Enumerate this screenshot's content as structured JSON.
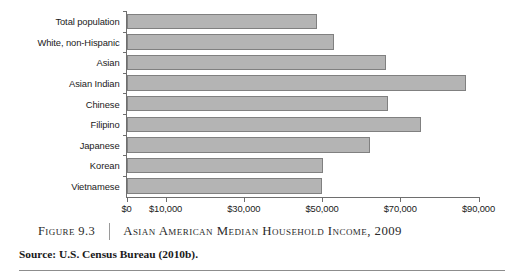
{
  "chart_data": {
    "type": "bar",
    "orientation": "horizontal",
    "title": "Asian American Median Household Income, 2009",
    "xlabel": "",
    "ylabel": "",
    "grid": false,
    "legend": null,
    "xlim": [
      0,
      95000
    ],
    "categories": [
      "Total population",
      "White, non-Hispanic",
      "Asian",
      "Asian Indian",
      "Chinese",
      "Filipino",
      "Japanese",
      "Korean",
      "Vietnamese"
    ],
    "values": [
      48600,
      53000,
      66400,
      86700,
      66800,
      75400,
      62200,
      50200,
      50000
    ],
    "tick_values": [
      0,
      10000,
      30000,
      50000,
      70000,
      90000
    ],
    "tick_labels": [
      "$0",
      "$10,000",
      "$30,000",
      "$50,000",
      "$70,000",
      "$90,000"
    ],
    "bar_color": "#b4b4b4",
    "bar_border_color": "#808080",
    "axis_color": "#6e6e6e"
  },
  "caption": {
    "figure_number": "Figure 9.3",
    "title": "Asian American Median Household Income, 2009",
    "source": "Source: U.S. Census Bureau (2010b)."
  }
}
